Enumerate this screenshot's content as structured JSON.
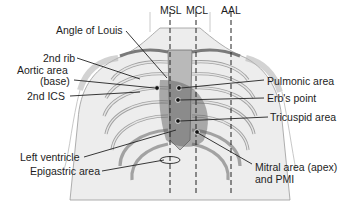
{
  "diagram": {
    "type": "anatomical-labeled-illustration",
    "reference_lines": [
      {
        "id": "msl",
        "label": "MSL",
        "style": "dashed"
      },
      {
        "id": "mcl",
        "label": "MCL",
        "style": "dashed"
      },
      {
        "id": "aal",
        "label": "AAL",
        "style": "dashed"
      }
    ],
    "labels_left": [
      {
        "id": "angle-of-louis",
        "text": "Angle of Louis"
      },
      {
        "id": "2nd-rib",
        "text": "2nd rib"
      },
      {
        "id": "aortic-area-1",
        "text": "Aortic area"
      },
      {
        "id": "aortic-area-2",
        "text": "(base)"
      },
      {
        "id": "2nd-ics",
        "text": "2nd ICS"
      },
      {
        "id": "left-ventricle",
        "text": "Left ventricle"
      },
      {
        "id": "epigastric-area",
        "text": "Epigastric area"
      }
    ],
    "labels_right": [
      {
        "id": "pulmonic-area",
        "text": "Pulmonic area"
      },
      {
        "id": "erbs-point",
        "text": "Erb's point"
      },
      {
        "id": "tricuspid-area",
        "text": "Tricuspid area"
      },
      {
        "id": "mitral-area-1",
        "text": "Mitral area (apex)"
      },
      {
        "id": "mitral-area-2",
        "text": "and PMI"
      }
    ]
  }
}
